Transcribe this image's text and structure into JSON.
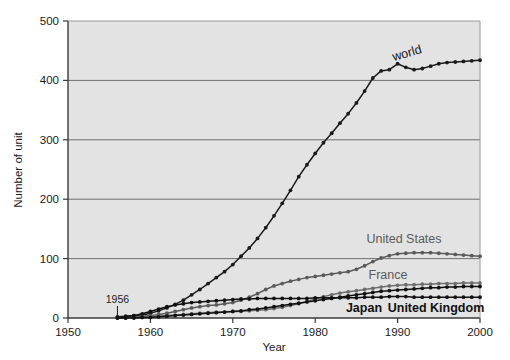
{
  "chart_data": {
    "type": "line",
    "title": "",
    "xlabel": "Year",
    "ylabel": "Number of unit",
    "xlim": [
      1950,
      2000
    ],
    "ylim": [
      0,
      500
    ],
    "xticks": [
      1950,
      1960,
      1970,
      1980,
      1990,
      2000
    ],
    "yticks": [
      0,
      100,
      200,
      300,
      400,
      500
    ],
    "grid": true,
    "legend_position": "inline-labels",
    "plot_background": "#e3e3e3",
    "annotations": [
      {
        "text": "1956",
        "x": 1956,
        "y": 0,
        "note": "start year marker on x-axis"
      }
    ],
    "x": [
      1956,
      1957,
      1958,
      1959,
      1960,
      1961,
      1962,
      1963,
      1964,
      1965,
      1966,
      1967,
      1968,
      1969,
      1970,
      1971,
      1972,
      1973,
      1974,
      1975,
      1976,
      1977,
      1978,
      1979,
      1980,
      1981,
      1982,
      1983,
      1984,
      1985,
      1986,
      1987,
      1988,
      1989,
      1990,
      1991,
      1992,
      1993,
      1994,
      1995,
      1996,
      1997,
      1998,
      1999,
      2000
    ],
    "series": [
      {
        "name": "world",
        "color": "#1a1a1a",
        "label_text": "world",
        "values": [
          2,
          3,
          4,
          5,
          8,
          12,
          17,
          23,
          30,
          39,
          48,
          58,
          68,
          78,
          90,
          104,
          118,
          134,
          152,
          172,
          193,
          215,
          238,
          258,
          277,
          295,
          311,
          328,
          344,
          362,
          382,
          404,
          416,
          418,
          428,
          422,
          418,
          420,
          424,
          428,
          430,
          431,
          432,
          433,
          434
        ]
      },
      {
        "name": "United States",
        "color": "#5a5a5a",
        "label_text": "United States",
        "values": [
          1,
          1,
          2,
          3,
          4,
          6,
          8,
          11,
          14,
          17,
          19,
          21,
          22,
          24,
          26,
          30,
          35,
          41,
          48,
          54,
          58,
          62,
          65,
          68,
          70,
          72,
          74,
          76,
          78,
          82,
          88,
          95,
          101,
          105,
          108,
          109,
          110,
          110,
          110,
          109,
          108,
          107,
          106,
          105,
          104
        ]
      },
      {
        "name": "France",
        "color": "#6e6e6e",
        "label_text": "France",
        "values": [
          0,
          0,
          1,
          1,
          2,
          3,
          4,
          5,
          6,
          7,
          8,
          9,
          10,
          10,
          11,
          11,
          12,
          13,
          14,
          16,
          18,
          21,
          24,
          28,
          32,
          36,
          39,
          42,
          44,
          46,
          48,
          50,
          52,
          54,
          55,
          56,
          56,
          57,
          57,
          58,
          58,
          58,
          59,
          59,
          59
        ]
      },
      {
        "name": "Japan",
        "color": "#111111",
        "label_text": "Japan",
        "values": [
          0,
          0,
          0,
          1,
          1,
          2,
          3,
          4,
          5,
          6,
          7,
          8,
          9,
          10,
          11,
          12,
          14,
          15,
          17,
          19,
          21,
          23,
          25,
          27,
          29,
          31,
          33,
          35,
          37,
          39,
          41,
          43,
          45,
          46,
          47,
          48,
          49,
          50,
          51,
          51,
          52,
          52,
          53,
          53,
          53
        ]
      },
      {
        "name": "United Kingdom",
        "color": "#111111",
        "label_text": "United Kingdom",
        "values": [
          1,
          2,
          4,
          7,
          11,
          15,
          19,
          22,
          24,
          26,
          27,
          28,
          29,
          30,
          31,
          32,
          32,
          33,
          33,
          33,
          33,
          33,
          33,
          33,
          34,
          34,
          34,
          34,
          34,
          34,
          35,
          35,
          35,
          36,
          36,
          36,
          35,
          35,
          35,
          35,
          35,
          35,
          35,
          35,
          35
        ]
      }
    ]
  },
  "axis": {
    "y_title": "Number of unit",
    "x_title": "Year",
    "y_tick_labels": [
      "500",
      "400",
      "300",
      "200",
      "100",
      "0"
    ],
    "x_tick_labels": [
      "1950",
      "1960",
      "1970",
      "1980",
      "1990",
      "2000"
    ]
  },
  "labels": {
    "world": "world",
    "united_states": "United States",
    "france": "France",
    "japan": "Japan",
    "united_kingdom": "United Kingdom",
    "start_year": "1956"
  }
}
